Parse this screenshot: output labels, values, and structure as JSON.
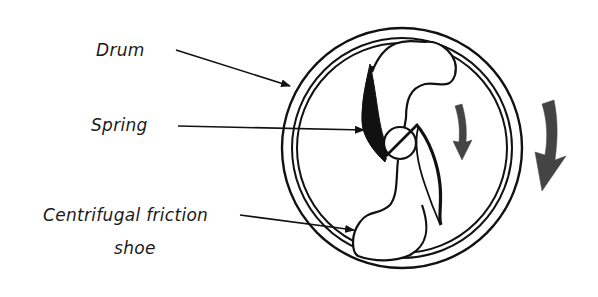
{
  "diagram": {
    "labels": {
      "drum": "Drum",
      "spring": "Spring",
      "shoe_line1": "Centrifugal friction",
      "shoe_line2": "shoe"
    },
    "components": [
      "drum",
      "spring",
      "hub",
      "centrifugal-friction-shoe",
      "rotation-arrow-inner",
      "rotation-arrow-outer"
    ],
    "colors": {
      "line": "#111111",
      "arrow_fill": "#444444",
      "background": "#ffffff"
    }
  }
}
